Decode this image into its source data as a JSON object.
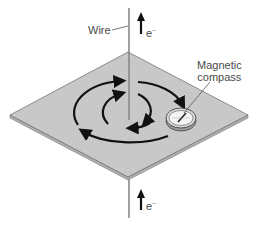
{
  "diagram": {
    "labels": {
      "wire": "Wire",
      "electron_top": "e",
      "electron_top_sup": "−",
      "electron_bottom": "e",
      "electron_bottom_sup": "−",
      "compass_line1": "Magnetic",
      "compass_line2": "compass"
    },
    "colors": {
      "plate_fill": "#c8c8c8",
      "plate_edge": "#a8a8a8",
      "wire": "#8a8a8a",
      "arrows": "#111111",
      "text": "#4a4a4a",
      "compass_face": "#f4f4f4"
    },
    "elements": [
      "vertical current-carrying wire",
      "horizontal plate (isometric)",
      "two concentric circular magnetic field lines with arrowheads (counter-clockwise as viewed)",
      "magnetic compass on plate",
      "electron flow arrows pointing up above and below plate"
    ]
  }
}
